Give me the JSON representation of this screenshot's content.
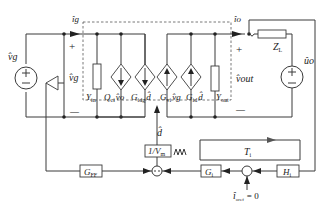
{
  "diagram": {
    "type": "small-signal circuit with control loop block diagram",
    "input": {
      "source_label": "v̂g",
      "current_label": "îg",
      "port_plus": "+",
      "port_minus": "—",
      "voltage_label": "v̂g"
    },
    "converter_block": {
      "elements": [
        {
          "name": "Y_in",
          "label_main": "Y",
          "label_sub": "in",
          "kind": "admittance"
        },
        {
          "name": "Q_ci v_o",
          "label_main": "Q",
          "label_sub": "ci",
          "extra": "v̂o",
          "kind": "dependent-current-source-down"
        },
        {
          "name": "G_idg d",
          "label_main": "G",
          "label_sub": "idg",
          "extra": "d̂",
          "kind": "dependent-current-source-down"
        },
        {
          "name": "G_vi v_g",
          "label_main": "G",
          "label_sub": "vi",
          "extra": "v̂g",
          "kind": "dependent-current-source-up"
        },
        {
          "name": "G_id d",
          "label_main": "G",
          "label_sub": "id",
          "extra": "d̂",
          "kind": "dependent-current-source-up"
        },
        {
          "name": "Y_out",
          "label_main": "Y",
          "label_sub": "out",
          "kind": "admittance"
        }
      ]
    },
    "output": {
      "current_label": "îo",
      "port_plus": "+",
      "port_minus": "—",
      "voltage_label": "v̂out",
      "load_main": "Z",
      "load_sub": "L",
      "source_label": "ûo"
    },
    "control": {
      "duty_label": "d̂",
      "modulator_label": "1/V",
      "modulator_sub": "m",
      "sawtooth": "ΛΛΛ",
      "feedforward_main": "G",
      "feedforward_sub": "FF",
      "controller_main": "G",
      "controller_sub": "i",
      "sensor_main": "H",
      "sensor_sub": "i",
      "loop_gain_main": "T",
      "loop_gain_sub": "i",
      "reference_main": "î",
      "reference_sub": "oref",
      "reference_value": "= 0"
    }
  }
}
